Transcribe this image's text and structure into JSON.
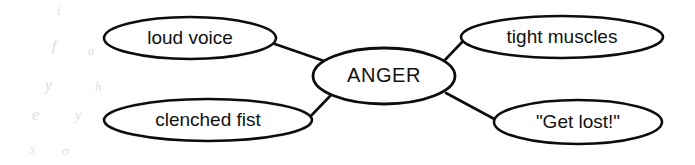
{
  "diagram": {
    "type": "concept-map",
    "title": "ANGER",
    "background_color": "#ffffff",
    "stroke_color": "#0d0d0d",
    "text_color": "#111111",
    "center_node": {
      "id": "anger",
      "label": "ANGER",
      "cx": 384,
      "cy": 76,
      "rx": 71,
      "ry": 28
    },
    "satellite_nodes": [
      {
        "id": "loud-voice",
        "label": "loud voice",
        "position": "top-left",
        "cx": 190,
        "cy": 38,
        "rx": 86,
        "ry": 21
      },
      {
        "id": "tight-muscles",
        "label": "tight muscles",
        "position": "top-right",
        "cx": 562,
        "cy": 37,
        "rx": 101,
        "ry": 21
      },
      {
        "id": "clenched-fist",
        "label": "clenched fist",
        "position": "bottom-left",
        "cx": 208,
        "cy": 120,
        "rx": 104,
        "ry": 21
      },
      {
        "id": "get-lost",
        "label": "\"Get lost!\"",
        "position": "bottom-right",
        "cx": 578,
        "cy": 122,
        "rx": 84,
        "ry": 22
      }
    ],
    "connectors": [
      {
        "id": "anger-to-loud-voice",
        "from": "anger",
        "to": "loud-voice",
        "x1": 327,
        "y1": 62,
        "x2": 272,
        "y2": 43
      },
      {
        "id": "anger-to-tight-muscles",
        "from": "anger",
        "to": "tight-muscles",
        "x1": 444,
        "y1": 61,
        "x2": 464,
        "y2": 40
      },
      {
        "id": "anger-to-clenched-fist",
        "from": "anger",
        "to": "clenched-fist",
        "x1": 331,
        "y1": 95,
        "x2": 308,
        "y2": 119
      },
      {
        "id": "anger-to-get-lost",
        "from": "anger",
        "to": "get-lost",
        "x1": 446,
        "y1": 93,
        "x2": 498,
        "y2": 121
      }
    ],
    "artifacts": {
      "description": "faint scanner bleed-through marks in left margin",
      "color": "#dcdcdc",
      "marks": [
        {
          "id": "ghost-1",
          "glyph": "i",
          "x": 57,
          "y": 12,
          "size": 13
        },
        {
          "id": "ghost-2",
          "glyph": "f",
          "x": 52,
          "y": 48,
          "size": 15
        },
        {
          "id": "ghost-3",
          "glyph": "a",
          "x": 88,
          "y": 52,
          "size": 12
        },
        {
          "id": "ghost-4",
          "glyph": "y",
          "x": 45,
          "y": 86,
          "size": 16
        },
        {
          "id": "ghost-5",
          "glyph": "h",
          "x": 95,
          "y": 88,
          "size": 13
        },
        {
          "id": "ghost-6",
          "glyph": "e",
          "x": 32,
          "y": 116,
          "size": 17
        },
        {
          "id": "ghost-7",
          "glyph": "y",
          "x": 75,
          "y": 117,
          "size": 14
        },
        {
          "id": "ghost-8",
          "glyph": "s",
          "x": 30,
          "y": 150,
          "size": 13
        },
        {
          "id": "ghost-9",
          "glyph": "o",
          "x": 62,
          "y": 152,
          "size": 13
        }
      ]
    }
  }
}
